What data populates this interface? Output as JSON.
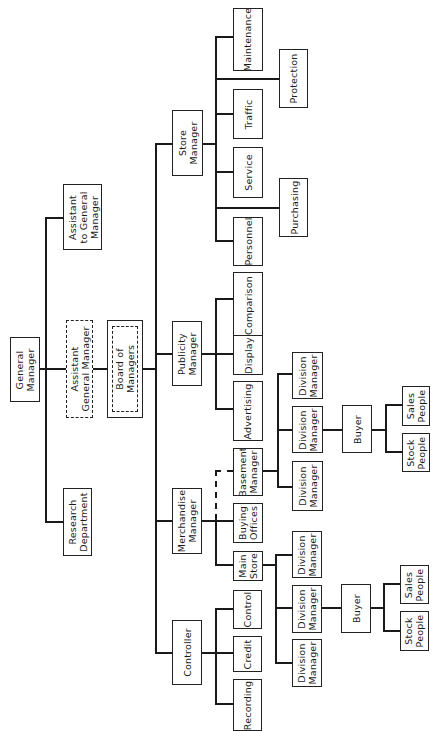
{
  "diagram": {
    "type": "organization-chart",
    "orientation": "rotated 90deg counter-clockwise (root on left)",
    "nodes": {
      "general_manager": "General\nManager",
      "assistant_general_manager": "Assistant\nGeneral Manager",
      "board_of_managers": "Board of\nManagers",
      "assistant_to_general_manager": "Assistant\nto General\nManager",
      "research_department": "Research\nDepartment",
      "store_manager": "Store\nManager",
      "publicity_manager": "Publicity\nManager",
      "merchandise_manager": "Merchandise\nManager",
      "controller": "Controller",
      "maintenance": "Maintenance",
      "protection": "Protection",
      "traffic": "Traffic",
      "service": "Service",
      "purchasing": "Purchasing",
      "personnel": "Personnel",
      "comparison": "Comparison",
      "display": "Display",
      "advertising": "Advertising",
      "basement_manager": "Basement\nManager",
      "buying_offices": "Buying\nOffices",
      "main_store": "Main\nStore",
      "basement_division_1": "Division\nManager",
      "basement_division_2": "Division\nManager",
      "basement_division_3": "Division\nManager",
      "basement_buyer": "Buyer",
      "basement_sales_people": "Sales\nPeople",
      "basement_stock_people": "Stock\nPeople",
      "main_division_1": "Division\nManager",
      "main_division_2": "Division\nManager",
      "main_division_3": "Division\nManager",
      "main_buyer": "Buyer",
      "main_sales_people": "Sales\nPeople",
      "main_stock_people": "Stock\nPeople",
      "control": "Control",
      "credit": "Credit",
      "recording": "Recording"
    },
    "edges": [
      [
        "general_manager",
        "assistant_general_manager",
        "dashed-box"
      ],
      [
        "assistant_general_manager",
        "board_of_managers"
      ],
      [
        "general_manager",
        "assistant_to_general_manager"
      ],
      [
        "general_manager",
        "research_department"
      ],
      [
        "board_of_managers",
        "store_manager"
      ],
      [
        "board_of_managers",
        "publicity_manager"
      ],
      [
        "board_of_managers",
        "merchandise_manager"
      ],
      [
        "board_of_managers",
        "controller"
      ],
      [
        "store_manager",
        "maintenance"
      ],
      [
        "store_manager",
        "protection"
      ],
      [
        "store_manager",
        "traffic"
      ],
      [
        "store_manager",
        "service"
      ],
      [
        "store_manager",
        "purchasing"
      ],
      [
        "store_manager",
        "personnel"
      ],
      [
        "publicity_manager",
        "comparison"
      ],
      [
        "publicity_manager",
        "display"
      ],
      [
        "publicity_manager",
        "advertising"
      ],
      [
        "merchandise_manager",
        "basement_manager",
        "dashed"
      ],
      [
        "merchandise_manager",
        "buying_offices"
      ],
      [
        "merchandise_manager",
        "main_store"
      ],
      [
        "basement_manager",
        "basement_division_1"
      ],
      [
        "basement_manager",
        "basement_division_2"
      ],
      [
        "basement_manager",
        "basement_division_3"
      ],
      [
        "basement_division_2",
        "basement_buyer"
      ],
      [
        "basement_buyer",
        "basement_sales_people"
      ],
      [
        "basement_buyer",
        "basement_stock_people"
      ],
      [
        "main_store",
        "main_division_1"
      ],
      [
        "main_store",
        "main_division_2"
      ],
      [
        "main_store",
        "main_division_3"
      ],
      [
        "main_division_2",
        "main_buyer"
      ],
      [
        "main_buyer",
        "main_sales_people"
      ],
      [
        "main_buyer",
        "main_stock_people"
      ],
      [
        "controller",
        "control"
      ],
      [
        "controller",
        "credit"
      ],
      [
        "controller",
        "recording"
      ]
    ]
  }
}
